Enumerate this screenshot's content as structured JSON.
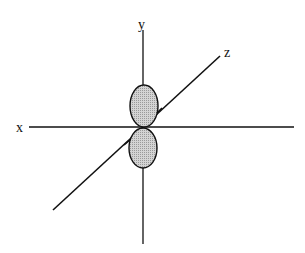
{
  "diagram": {
    "type": "p-orbital (p_y) along y-axis",
    "axes": {
      "x": {
        "label": "x"
      },
      "y": {
        "label": "y"
      },
      "z": {
        "label": "z"
      }
    },
    "lobes": [
      {
        "name": "upper-lobe",
        "fill": "#c8c8c8"
      },
      {
        "name": "lower-lobe",
        "fill": "#c8c8c8"
      }
    ],
    "colors": {
      "line": "#111111",
      "lobe_fill": "#c8c8c8",
      "background": "#ffffff"
    }
  }
}
